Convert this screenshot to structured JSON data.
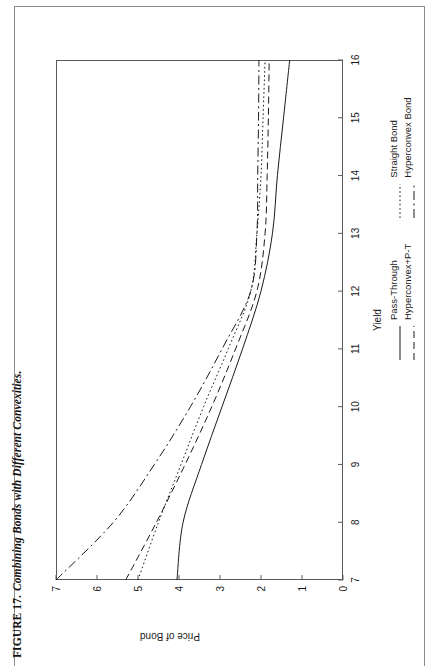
{
  "caption": {
    "number": "FIGURE 17.",
    "text": "Combining Bonds with Different Convexities."
  },
  "chart_data": {
    "type": "line",
    "title": "",
    "xlabel": "Yield",
    "ylabel": "Price of Bond",
    "xlim": [
      7,
      16
    ],
    "ylim": [
      0,
      7
    ],
    "xticks": [
      "7",
      "8",
      "9",
      "10",
      "11",
      "12",
      "13",
      "14",
      "15",
      "16"
    ],
    "yticks": [
      "0",
      "1",
      "2",
      "3",
      "4",
      "5",
      "6",
      "7"
    ],
    "grid": false,
    "legend_position": "below-right",
    "x": [
      7,
      8,
      9,
      10,
      11,
      12,
      13,
      14,
      15,
      16
    ],
    "series": [
      {
        "name": "Pass-Through",
        "style": "solid",
        "values": [
          4.05,
          3.9,
          3.45,
          2.95,
          2.45,
          2.0,
          1.72,
          1.6,
          1.45,
          1.3
        ]
      },
      {
        "name": "Hyperconvex+P-T",
        "style": "dashed",
        "values": [
          5.3,
          4.55,
          3.85,
          3.2,
          2.62,
          2.1,
          1.9,
          1.85,
          1.82,
          1.8
        ]
      },
      {
        "name": "Straight Bond",
        "style": "dotted",
        "values": [
          5.0,
          4.5,
          3.95,
          3.4,
          2.8,
          2.25,
          2.1,
          2.0,
          1.95,
          1.9
        ]
      },
      {
        "name": "Hyperconvex Bond",
        "style": "dash-dot",
        "values": [
          7.0,
          5.6,
          4.6,
          3.72,
          2.95,
          2.25,
          2.1,
          2.08,
          2.06,
          2.05
        ]
      }
    ]
  },
  "legend": {
    "columns": [
      {
        "entries": [
          {
            "label": "Pass-Through",
            "style": "solid"
          },
          {
            "label": "Hyperconvex+P-T",
            "style": "dashed"
          }
        ]
      },
      {
        "entries": [
          {
            "label": "Straight Bond",
            "style": "dotted"
          },
          {
            "label": "Hyperconvex Bond",
            "style": "dash-dot"
          }
        ]
      }
    ]
  },
  "colors": {
    "ink": "#1a1a1a",
    "frame": "#5a5a5a",
    "page_rule": "#8d8d8d",
    "background": "#ffffff"
  }
}
